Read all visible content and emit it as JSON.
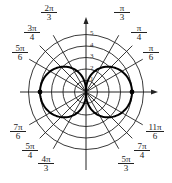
{
  "chart_data": {
    "type": "line",
    "coordinate_system": "polar",
    "title": "",
    "curve": {
      "shape": "figure-eight (two lobes along polar axis)",
      "max_r": 4,
      "points_marked": [
        {
          "r": 4,
          "theta": "0"
        },
        {
          "r": 4,
          "theta": "π"
        }
      ]
    },
    "radial_ticks": [
      "1",
      "2",
      "3",
      "4",
      "5"
    ],
    "rlim": [
      0,
      5
    ],
    "angle_labels": [
      {
        "angle_deg": 30,
        "num": "π",
        "den": "6"
      },
      {
        "angle_deg": 45,
        "num": "π",
        "den": "4"
      },
      {
        "angle_deg": 60,
        "num": "π",
        "den": "3"
      },
      {
        "angle_deg": 120,
        "num": "2π",
        "den": "3"
      },
      {
        "angle_deg": 135,
        "num": "3π",
        "den": "4"
      },
      {
        "angle_deg": 150,
        "num": "5π",
        "den": "6"
      },
      {
        "angle_deg": 210,
        "num": "7π",
        "den": "6"
      },
      {
        "angle_deg": 225,
        "num": "5π",
        "den": "4"
      },
      {
        "angle_deg": 240,
        "num": "4π",
        "den": "3"
      },
      {
        "angle_deg": 300,
        "num": "5π",
        "den": "3"
      },
      {
        "angle_deg": 315,
        "num": "7π",
        "den": "4"
      },
      {
        "angle_deg": 330,
        "num": "11π",
        "den": "6"
      }
    ],
    "grid": true,
    "colors": {
      "grid": "#222222",
      "curve": "#000000",
      "background": "#ffffff"
    }
  }
}
